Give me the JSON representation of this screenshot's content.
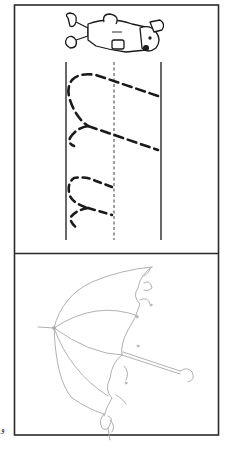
{
  "worksheet": {
    "type": "letter-tracing-worksheet",
    "orientation": "rotated-90",
    "colors": {
      "border": "#2a2a2a",
      "guide_lines": "#2a2a2a",
      "tracing_strokes": "#1a1a1a",
      "illustration_faint": "#a8a8a8",
      "background": "#ffffff"
    },
    "top_panel": {
      "icon": "cartoon-bear-character-icon",
      "tracing_letter_row_1": "large dashed letter (traced)",
      "tracing_letter_row_2": "small dashed letter (traced)"
    },
    "bottom_panel": {
      "icon": "umbrella-illustration-icon"
    },
    "corner_mark": "و"
  }
}
